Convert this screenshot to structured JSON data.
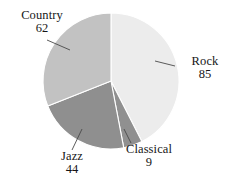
{
  "chart_data": {
    "type": "pie",
    "title": "",
    "subtitle": "",
    "xlabel": "",
    "ylabel": "",
    "legend_position": "none",
    "grid": false,
    "total": 200,
    "categories": [
      "Rock",
      "Classical",
      "Jazz",
      "Country"
    ],
    "values": [
      85,
      9,
      44,
      62
    ],
    "slices": [
      {
        "label": "Rock",
        "value": 85,
        "value_text": "85",
        "percent": 42.5,
        "angle_deg": 153.0,
        "start_deg": 0.0,
        "end_deg": 153.0,
        "color": "#ececec",
        "label_position": "right"
      },
      {
        "label": "Classical",
        "value": 9,
        "value_text": "9",
        "percent": 4.5,
        "angle_deg": 16.2,
        "start_deg": 153.0,
        "end_deg": 169.2,
        "color": "#909090",
        "label_position": "bottom"
      },
      {
        "label": "Jazz",
        "value": 44,
        "value_text": "44",
        "percent": 22.0,
        "angle_deg": 79.2,
        "start_deg": 169.2,
        "end_deg": 248.4,
        "color": "#8f8f8f",
        "label_position": "bottom-left"
      },
      {
        "label": "Country",
        "value": 62,
        "value_text": "62",
        "percent": 31.0,
        "angle_deg": 111.6,
        "start_deg": 248.4,
        "end_deg": 360.0,
        "color": "#c2c2c2",
        "label_position": "top-left"
      }
    ],
    "geometry": {
      "center_x": 111,
      "center_y": 81,
      "radius": 68,
      "start_angle_deg": 0,
      "direction": "clockwise"
    },
    "style": {
      "background": "#ffffff",
      "slice_border": "#ffffff",
      "leader_line_color": "#4a4a4a",
      "text_color": "#161616"
    }
  }
}
